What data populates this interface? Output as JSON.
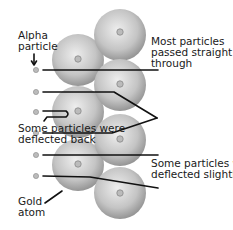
{
  "diagram": {
    "labels": {
      "alpha_particle": "Alpha\nparticle",
      "passed_straight": "Most particles\npassed straight\nthrough",
      "deflected_back": "Some particles were\ndeflected back",
      "deflected_slightly": "Some particles were\ndeflected slightly",
      "gold_atom": "Gold\natom"
    },
    "colors": {
      "atom_light": "#e6e6e6",
      "atom_dark": "#8a8a8a",
      "nucleus": "#9a9a9a",
      "path": "#111111",
      "text": "#1a1a1a"
    },
    "atoms": [
      {
        "cx": 78,
        "cy": 60,
        "r": 26
      },
      {
        "cx": 78,
        "cy": 112,
        "r": 26
      },
      {
        "cx": 78,
        "cy": 165,
        "r": 26
      },
      {
        "cx": 120,
        "cy": 35,
        "r": 26
      },
      {
        "cx": 120,
        "cy": 85,
        "r": 26
      },
      {
        "cx": 120,
        "cy": 140,
        "r": 26
      },
      {
        "cx": 120,
        "cy": 193,
        "r": 26
      }
    ]
  }
}
